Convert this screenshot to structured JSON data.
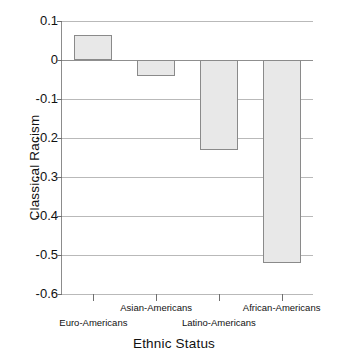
{
  "chart_data": {
    "type": "bar",
    "title": "",
    "xlabel": "Ethnic Status",
    "ylabel": "Classical Racism",
    "categories": [
      "Euro-Americans",
      "Asian-Americans",
      "Latino-Americans",
      "African-Americans"
    ],
    "values": [
      0.065,
      -0.04,
      -0.23,
      -0.52
    ],
    "ylim": [
      -0.6,
      0.1
    ],
    "yticks": [
      0.1,
      0,
      -0.1,
      -0.2,
      -0.3,
      -0.4,
      -0.5,
      -0.6
    ],
    "ytick_labels": [
      "0.1",
      "0",
      "-0.1",
      "-0.2",
      "-0.3",
      "-0.4",
      "-0.5",
      "-0.6"
    ],
    "grid": true,
    "legend": "none",
    "bar_fill_color": "#e8e8e8",
    "bar_edge_color": "#8a8a8a",
    "gridline_color": "#b9b9b9",
    "axis_color": "#8c8c8c",
    "label_rows": [
      1,
      0,
      1,
      0
    ]
  }
}
